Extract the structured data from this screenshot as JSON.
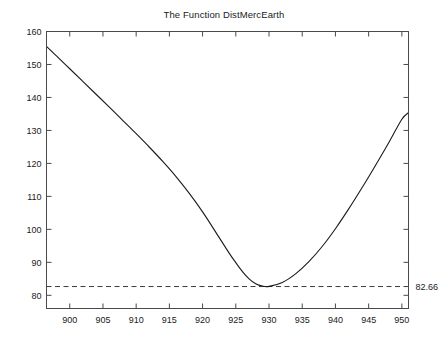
{
  "chart_data": {
    "type": "line",
    "title": "The Function DistMercEarth",
    "xlabel": "",
    "ylabel": "",
    "xlim": [
      896.5,
      951.0
    ],
    "ylim": [
      76.0,
      160.0
    ],
    "grid": false,
    "legend": "none",
    "box": true,
    "tick_direction": "in",
    "x_ticks": [
      900,
      905,
      910,
      915,
      920,
      925,
      930,
      935,
      940,
      945,
      950
    ],
    "x_tick_labels": [
      "900",
      "905",
      "910",
      "915",
      "920",
      "925",
      "930",
      "935",
      "940",
      "945",
      "950"
    ],
    "y_ticks": [
      80,
      90,
      100,
      110,
      120,
      130,
      140,
      150,
      160
    ],
    "y_tick_labels": [
      "80",
      "90",
      "100",
      "110",
      "120",
      "130",
      "140",
      "150",
      "160"
    ],
    "series": [
      {
        "name": "DistMercEarth",
        "style": "solid",
        "color": "#1a1a1a",
        "width": 1.1,
        "x": [
          896.5,
          898,
          900,
          902,
          904,
          906,
          908,
          910,
          912,
          914,
          916,
          918,
          920,
          922,
          924,
          925,
          926,
          927,
          928,
          929,
          930,
          932,
          934,
          936,
          938,
          940,
          942,
          944,
          946,
          948,
          950,
          951
        ],
        "y": [
          155.5,
          152.6,
          148.7,
          144.8,
          140.9,
          137.0,
          133.0,
          129.0,
          124.9,
          120.6,
          116.0,
          110.9,
          105.3,
          99.1,
          92.8,
          89.9,
          87.2,
          85.0,
          83.5,
          82.8,
          82.7,
          83.9,
          86.5,
          90.2,
          94.8,
          100.2,
          106.2,
          112.6,
          119.3,
          126.2,
          133.4,
          135.4
        ]
      }
    ],
    "annotations": [
      {
        "type": "hline",
        "name": "minimum-reference-line",
        "value": 82.66,
        "label": "82.66",
        "style": "dashed",
        "color": "#3a3a3a",
        "label_position": "right-outside"
      }
    ],
    "minimum_point": {
      "x": 927.3,
      "y": 82.66
    }
  },
  "figure": {
    "background_color": "#ffffff",
    "axes_color": "#4a4a4a"
  }
}
